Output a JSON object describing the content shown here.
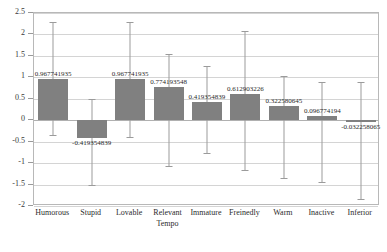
{
  "chart_data": {
    "type": "bar",
    "title": "",
    "xlabel": "Tempo",
    "ylabel": "",
    "ylim": [
      -2,
      2.5
    ],
    "ytick_step": 0.5,
    "grid": true,
    "legend": false,
    "bar_color": "#808080",
    "errorbar_color": "#9b9b9b",
    "categories": [
      "Humorous",
      "Stupid",
      "Lovable",
      "Relevant",
      "Immature",
      "Freinedly",
      "Warm",
      "Inactive",
      "Inferior"
    ],
    "values": [
      0.967741935,
      -0.419354839,
      0.967741935,
      0.774193548,
      0.419354839,
      0.612903226,
      0.322580645,
      0.096774194,
      -0.032258065
    ],
    "value_labels": [
      "0.967741935",
      "-0.419354839",
      "0.967741935",
      "0.774193548",
      "0.419354839",
      "0.612903226",
      "0.322580645",
      "0.096774194",
      "-0.032258065"
    ],
    "error_high": [
      2.3,
      0.5,
      2.3,
      1.55,
      1.27,
      2.08,
      1.03,
      0.9,
      0.88
    ],
    "error_low": [
      -0.35,
      -1.52,
      -0.38,
      -1.06,
      -0.77,
      -1.15,
      -1.34,
      -1.45,
      -1.83
    ],
    "ytick_labels": [
      "2.5",
      "2",
      "1.5",
      "1",
      "0.5",
      "0",
      "-0.5",
      "-1",
      "-1.5",
      "-2"
    ],
    "ytick_values": [
      2.5,
      2,
      1.5,
      1,
      0.5,
      0,
      -0.5,
      -1,
      -1.5,
      -2
    ]
  }
}
